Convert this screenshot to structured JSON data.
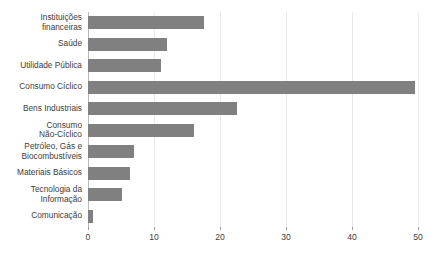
{
  "chart_data": {
    "type": "bar",
    "orientation": "horizontal",
    "title": "",
    "subtitle": "",
    "xlabel": "",
    "ylabel": "",
    "xlim": [
      0,
      52
    ],
    "grid": true,
    "legend": false,
    "bar_color": "#808080",
    "axis_color": "#b8b8b8",
    "grid_color": "#e9e9e9",
    "xticks": [
      0,
      10,
      20,
      30,
      40,
      50
    ],
    "xtick_labels": [
      "0",
      "10",
      "20",
      "30",
      "40",
      "50"
    ],
    "categories": [
      "Instituições financeiras",
      "Saúde",
      "Utilidade Pública",
      "Consumo Cíclico",
      "Bens Industriais",
      "Consumo Não-Cíclico",
      "Petróleo, Gás e Biocombustíveis",
      "Materiais Básicos",
      "Tecnologia da Informação",
      "Comunicação"
    ],
    "category_lines": [
      [
        "Instituições",
        "financeiras"
      ],
      [
        "Saúde"
      ],
      [
        "Utilidade Pública"
      ],
      [
        "Consumo Cíclico"
      ],
      [
        "Bens Industriais"
      ],
      [
        "Consumo",
        "Não-Cíclico"
      ],
      [
        "Petróleo, Gás e",
        "Biocombustíveis"
      ],
      [
        "Materiais Básicos"
      ],
      [
        "Tecnologia da",
        "Informação"
      ],
      [
        "Comunicação"
      ]
    ],
    "values": [
      17.5,
      12,
      11,
      49.5,
      22.5,
      16,
      7,
      6.4,
      5.2,
      0.8
    ]
  }
}
